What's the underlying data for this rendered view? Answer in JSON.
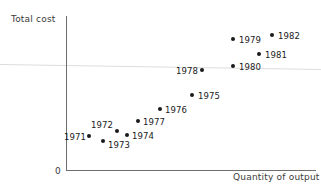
{
  "chart_data": {
    "type": "scatter",
    "title": "",
    "xlabel": "Quantity of output",
    "ylabel": "Total cost",
    "origin_label": "0",
    "grid": false,
    "legend": false,
    "axes_note": "Unlabeled qualitative axes; values read from pixel positions",
    "xlim": [
      0,
      1
    ],
    "ylim": [
      0,
      1
    ],
    "points": [
      {
        "label": "1971",
        "px": 89,
        "py": 136,
        "label_side": "left",
        "label_x": 86,
        "label_y": 137,
        "x": 0.092,
        "y": 0.221
      },
      {
        "label": "1972",
        "px": 117,
        "py": 131,
        "label_side": "right",
        "label_x": 91,
        "label_y": 125,
        "x": 0.204,
        "y": 0.253
      },
      {
        "label": "1973",
        "px": 103,
        "py": 141,
        "label_side": "right",
        "label_x": 108,
        "label_y": 145,
        "x": 0.148,
        "y": 0.188
      },
      {
        "label": "1974",
        "px": 127,
        "py": 135,
        "label_side": "right",
        "label_x": 132,
        "label_y": 136,
        "x": 0.244,
        "y": 0.227
      },
      {
        "label": "1975",
        "px": 192,
        "py": 95,
        "label_side": "right",
        "label_x": 198,
        "label_y": 96,
        "x": 0.504,
        "y": 0.487
      },
      {
        "label": "1976",
        "px": 160,
        "py": 109,
        "label_side": "right",
        "label_x": 165,
        "label_y": 110,
        "x": 0.376,
        "y": 0.396
      },
      {
        "label": "1977",
        "px": 138,
        "py": 121,
        "label_side": "right",
        "label_x": 143,
        "label_y": 122,
        "x": 0.288,
        "y": 0.318
      },
      {
        "label": "1978",
        "px": 202,
        "py": 70,
        "label_side": "left",
        "label_x": 198,
        "label_y": 71,
        "x": 0.544,
        "y": 0.649
      },
      {
        "label": "1979",
        "px": 233,
        "py": 39,
        "label_side": "right",
        "label_x": 239,
        "label_y": 40,
        "x": 0.668,
        "y": 0.851
      },
      {
        "label": "1980",
        "px": 233,
        "py": 66,
        "label_side": "right",
        "label_x": 239,
        "label_y": 67,
        "x": 0.668,
        "y": 0.675
      },
      {
        "label": "1981",
        "px": 259,
        "py": 54,
        "label_side": "right",
        "label_x": 265,
        "label_y": 55,
        "x": 0.772,
        "y": 0.753
      },
      {
        "label": "1982",
        "px": 272,
        "py": 35,
        "label_side": "right",
        "label_x": 278,
        "label_y": 36,
        "x": 0.824,
        "y": 0.877
      }
    ]
  },
  "colors": {
    "point": "#1a1a1a",
    "axis": "#6e6e6e",
    "text": "#3c3c3c",
    "background": "#ffffff"
  }
}
